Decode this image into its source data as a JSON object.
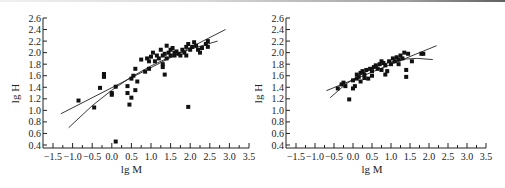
{
  "chart_data": [
    {
      "type": "scatter",
      "title": "",
      "xlabel": "lg M",
      "ylabel": "lg H",
      "xlim": [
        -1.5,
        3.5
      ],
      "ylim": [
        0.4,
        2.6
      ],
      "xticks": [
        "-1.5",
        "-1.0",
        "-0.5",
        "0.0",
        "0.5",
        "1.0",
        "1.5",
        "2.0",
        "2.5",
        "3.0",
        "3.5"
      ],
      "yticks": [
        "0.4",
        "0.6",
        "0.8",
        "1.0",
        "1.2",
        "1.4",
        "1.6",
        "1.8",
        "2.0",
        "2.2",
        "2.4",
        "2.6"
      ],
      "grid": false,
      "legend": null,
      "points": [
        [
          -0.85,
          1.17
        ],
        [
          -0.45,
          1.05
        ],
        [
          -0.3,
          1.39
        ],
        [
          -0.2,
          1.63
        ],
        [
          -0.2,
          1.58
        ],
        [
          -0.2,
          1.6
        ],
        [
          0.0,
          1.3
        ],
        [
          0.0,
          1.27
        ],
        [
          0.1,
          1.41
        ],
        [
          0.1,
          0.46
        ],
        [
          0.4,
          1.42
        ],
        [
          0.4,
          1.3
        ],
        [
          0.45,
          1.1
        ],
        [
          0.5,
          1.22
        ],
        [
          0.5,
          1.55
        ],
        [
          0.55,
          1.6
        ],
        [
          0.6,
          1.72
        ],
        [
          0.6,
          1.35
        ],
        [
          0.65,
          1.5
        ],
        [
          0.75,
          1.88
        ],
        [
          0.85,
          1.67
        ],
        [
          0.9,
          1.9
        ],
        [
          0.95,
          1.72
        ],
        [
          0.95,
          1.85
        ],
        [
          1.0,
          1.93
        ],
        [
          1.05,
          2.0
        ],
        [
          1.1,
          1.85
        ],
        [
          1.15,
          1.95
        ],
        [
          1.2,
          1.9
        ],
        [
          1.25,
          2.05
        ],
        [
          1.3,
          1.8
        ],
        [
          1.3,
          1.75
        ],
        [
          1.3,
          1.95
        ],
        [
          1.35,
          1.62
        ],
        [
          1.35,
          1.98
        ],
        [
          1.4,
          2.12
        ],
        [
          1.4,
          1.9
        ],
        [
          1.45,
          2.0
        ],
        [
          1.5,
          1.95
        ],
        [
          1.5,
          2.05
        ],
        [
          1.55,
          2.08
        ],
        [
          1.6,
          2.0
        ],
        [
          1.6,
          1.95
        ],
        [
          1.65,
          2.02
        ],
        [
          1.7,
          1.98
        ],
        [
          1.75,
          1.95
        ],
        [
          1.8,
          2.05
        ],
        [
          1.85,
          2.0
        ],
        [
          1.9,
          2.1
        ],
        [
          1.9,
          1.95
        ],
        [
          1.95,
          2.15
        ],
        [
          1.95,
          1.06
        ],
        [
          2.0,
          2.05
        ],
        [
          2.05,
          2.1
        ],
        [
          2.1,
          2.18
        ],
        [
          2.15,
          2.12
        ],
        [
          2.2,
          2.05
        ],
        [
          2.25,
          2.0
        ],
        [
          2.3,
          2.08
        ],
        [
          2.4,
          2.15
        ],
        [
          2.45,
          2.2
        ],
        [
          2.45,
          2.1
        ]
      ],
      "fit_lines": [
        {
          "name": "linear",
          "x": [
            -1.3,
            2.9
          ],
          "y": [
            0.94,
            2.4
          ]
        },
        {
          "name": "curve",
          "x": [
            -1.1,
            -0.5,
            0.0,
            0.5,
            1.0,
            1.5,
            2.0,
            2.7
          ],
          "y": [
            0.7,
            1.08,
            1.35,
            1.58,
            1.77,
            1.93,
            2.06,
            2.2
          ]
        }
      ]
    },
    {
      "type": "scatter",
      "title": "",
      "xlabel": "lg M",
      "ylabel": "lg H",
      "xlim": [
        -1.5,
        3.5
      ],
      "ylim": [
        0.4,
        2.6
      ],
      "xticks": [
        "-1.5",
        "-1.0",
        "-0.5",
        "0.0",
        "0.5",
        "1.0",
        "1.5",
        "2.0",
        "2.5",
        "3.0",
        "3.5"
      ],
      "yticks": [
        "0.4",
        "0.6",
        "0.8",
        "1.0",
        "1.2",
        "1.4",
        "1.6",
        "1.8",
        "2.0",
        "2.2",
        "2.4",
        "2.6"
      ],
      "grid": false,
      "legend": null,
      "points": [
        [
          -0.4,
          1.38
        ],
        [
          -0.3,
          1.45
        ],
        [
          -0.25,
          1.48
        ],
        [
          -0.2,
          1.42
        ],
        [
          -0.1,
          1.19
        ],
        [
          0.0,
          1.38
        ],
        [
          0.0,
          1.52
        ],
        [
          0.05,
          1.42
        ],
        [
          0.1,
          1.55
        ],
        [
          0.1,
          1.62
        ],
        [
          0.15,
          1.58
        ],
        [
          0.2,
          1.65
        ],
        [
          0.2,
          1.5
        ],
        [
          0.25,
          1.68
        ],
        [
          0.3,
          1.62
        ],
        [
          0.3,
          1.56
        ],
        [
          0.35,
          1.7
        ],
        [
          0.4,
          1.55
        ],
        [
          0.45,
          1.72
        ],
        [
          0.5,
          1.6
        ],
        [
          0.5,
          1.68
        ],
        [
          0.55,
          1.75
        ],
        [
          0.6,
          1.78
        ],
        [
          0.65,
          1.72
        ],
        [
          0.7,
          1.8
        ],
        [
          0.75,
          1.85
        ],
        [
          0.75,
          1.7
        ],
        [
          0.8,
          1.82
        ],
        [
          0.85,
          1.78
        ],
        [
          0.85,
          1.62
        ],
        [
          0.9,
          1.68
        ],
        [
          0.95,
          1.85
        ],
        [
          1.0,
          1.8
        ],
        [
          1.05,
          1.9
        ],
        [
          1.1,
          1.85
        ],
        [
          1.15,
          1.92
        ],
        [
          1.2,
          1.8
        ],
        [
          1.2,
          1.88
        ],
        [
          1.25,
          1.95
        ],
        [
          1.3,
          1.9
        ],
        [
          1.35,
          2.0
        ],
        [
          1.4,
          1.7
        ],
        [
          1.4,
          1.58
        ],
        [
          1.45,
          1.98
        ],
        [
          1.55,
          1.85
        ],
        [
          1.8,
          1.98
        ],
        [
          1.85,
          1.98
        ]
      ],
      "fit_lines": [
        {
          "name": "linear",
          "x": [
            -0.7,
            2.2
          ],
          "y": [
            1.34,
            2.12
          ]
        },
        {
          "name": "curve",
          "x": [
            -0.6,
            -0.2,
            0.2,
            0.6,
            1.0,
            1.4,
            1.7,
            2.1
          ],
          "y": [
            1.22,
            1.45,
            1.62,
            1.76,
            1.84,
            1.89,
            1.9,
            1.88
          ]
        }
      ]
    }
  ],
  "charts": [
    {
      "ylabel": "lg H",
      "xlabel": "lg M"
    },
    {
      "ylabel": "lg H",
      "xlabel": "lg M"
    }
  ]
}
